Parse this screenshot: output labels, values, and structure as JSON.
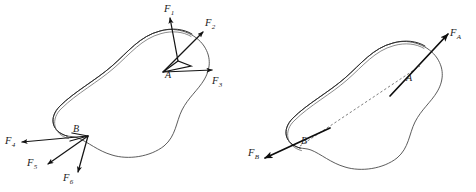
{
  "figure": {
    "panels": [
      {
        "id": "left-panel",
        "caption": "",
        "points": [
          {
            "name": "A",
            "label": "A",
            "x": 170,
            "y": 77
          },
          {
            "name": "B",
            "label": "B",
            "x": 77,
            "y": 131
          }
        ],
        "forces": [
          {
            "name": "F1",
            "label": "F",
            "sub": "1",
            "at": "A",
            "label_x": 168,
            "label_y": 6
          },
          {
            "name": "F2",
            "label": "F",
            "sub": "2",
            "at": "A",
            "label_x": 208,
            "label_y": 20
          },
          {
            "name": "F3",
            "label": "F",
            "sub": "3",
            "at": "A",
            "label_x": 214,
            "label_y": 79
          },
          {
            "name": "F4",
            "label": "F",
            "sub": "4",
            "at": "B",
            "label_x": 6,
            "label_y": 139
          },
          {
            "name": "F5",
            "label": "F",
            "sub": "5",
            "at": "B",
            "label_x": 28,
            "label_y": 160
          },
          {
            "name": "F6",
            "label": "F",
            "sub": "6",
            "at": "B",
            "label_x": 64,
            "label_y": 175
          }
        ]
      },
      {
        "id": "right-panel",
        "caption": "",
        "points": [
          {
            "name": "A",
            "label": "A",
            "x": 410,
            "y": 80
          },
          {
            "name": "B",
            "label": "B",
            "x": 305,
            "y": 143
          }
        ],
        "forces": [
          {
            "name": "FA",
            "label": "F",
            "sub": "A",
            "at": "A",
            "label_x": 452,
            "label_y": 30
          },
          {
            "name": "FB",
            "label": "F",
            "sub": "B",
            "at": "B",
            "label_x": 249,
            "label_y": 150
          }
        ],
        "action_line": {
          "from": "B",
          "to": "A",
          "style": "dashed"
        }
      }
    ],
    "colors": {
      "outline": "#4a4a4a",
      "outline_dark": "#2e2e2e",
      "arrow": "#111111",
      "action_line": "#5c5c5c",
      "background": "#ffffff",
      "text": "#1b1b1b"
    }
  }
}
